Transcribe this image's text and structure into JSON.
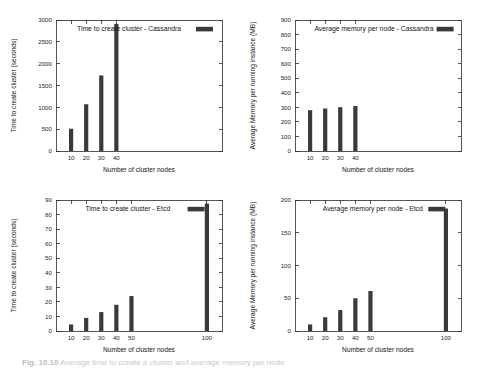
{
  "figure": {
    "caption_label": "Fig. 10.10",
    "caption_text": "Average time to create a cluster and average memory per node"
  },
  "chart_data": [
    {
      "id": "cassandra-time",
      "type": "bar",
      "title": "",
      "legend": "Time to create cluster - Cassandra",
      "legend_position": "top-center-inside",
      "xlabel": "Number of cluster nodes",
      "ylabel": "Time to create cluster (seconds)",
      "categories": [
        "10",
        "20",
        "30",
        "40"
      ],
      "x": [
        10,
        20,
        30,
        40
      ],
      "values": [
        510,
        1070,
        1730,
        2910
      ],
      "xlim": [
        0,
        110
      ],
      "ylim": [
        0,
        3000
      ],
      "yticks": [
        0,
        500,
        1000,
        1500,
        2000,
        2500,
        3000
      ],
      "xticks": [
        10,
        20,
        30,
        40
      ],
      "grid": false,
      "bar_color": "#3a3a3a"
    },
    {
      "id": "cassandra-memory",
      "type": "bar",
      "title": "",
      "legend": "Average memory per node - Cassandra",
      "legend_position": "top-center-inside",
      "xlabel": "Number of cluster nodes",
      "ylabel": "Average Memory per running instance (MB)",
      "categories": [
        "10",
        "20",
        "30",
        "40"
      ],
      "x": [
        10,
        20,
        30,
        40
      ],
      "values": [
        280,
        292,
        301,
        309
      ],
      "xlim": [
        0,
        110
      ],
      "ylim": [
        0,
        900
      ],
      "yticks": [
        0,
        100,
        200,
        300,
        400,
        500,
        600,
        700,
        800,
        900
      ],
      "xticks": [
        10,
        20,
        30,
        40
      ],
      "grid": false,
      "bar_color": "#3a3a3a"
    },
    {
      "id": "etcd-time",
      "type": "bar",
      "title": "",
      "legend": "Time to create cluster - Etcd",
      "legend_position": "top-center-inside",
      "xlabel": "Number of cluster nodes",
      "ylabel": "Time to create cluster (seconds)",
      "categories": [
        "10",
        "20",
        "30",
        "40",
        "50",
        "100"
      ],
      "x": [
        10,
        20,
        30,
        40,
        50,
        100
      ],
      "values": [
        4.5,
        9,
        13,
        18,
        24,
        87.5
      ],
      "xlim": [
        0,
        110
      ],
      "ylim": [
        0,
        90
      ],
      "yticks": [
        0,
        10,
        20,
        30,
        40,
        50,
        60,
        70,
        80,
        90
      ],
      "xticks": [
        10,
        20,
        30,
        40,
        50,
        100
      ],
      "grid": false,
      "bar_color": "#3a3a3a"
    },
    {
      "id": "etcd-memory",
      "type": "bar",
      "title": "",
      "legend": "Average memory per node - Etcd",
      "legend_position": "top-center-inside",
      "xlabel": "Number of cluster nodes",
      "ylabel": "Average Memory per running instance (MB)",
      "categories": [
        "10",
        "20",
        "30",
        "40",
        "50",
        "100"
      ],
      "x": [
        10,
        20,
        30,
        40,
        50,
        100
      ],
      "values": [
        10,
        21,
        32,
        50,
        61,
        187
      ],
      "xlim": [
        0,
        110
      ],
      "ylim": [
        0,
        200
      ],
      "yticks": [
        0,
        50,
        100,
        150,
        200
      ],
      "xticks": [
        10,
        20,
        30,
        40,
        50,
        100
      ],
      "grid": false,
      "bar_color": "#3a3a3a"
    }
  ]
}
